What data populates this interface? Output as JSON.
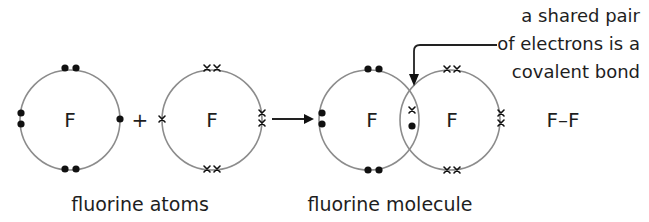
{
  "diagram": {
    "atoms_section": {
      "atom_left": {
        "symbol": "F",
        "electron_marker": "dot",
        "outer_electrons": 7
      },
      "plus_sign": "+",
      "atom_right": {
        "symbol": "F",
        "electron_marker": "cross",
        "outer_electrons": 7
      },
      "caption": "fluorine atoms"
    },
    "reaction_arrow": "right-arrow",
    "molecule_section": {
      "atom_left": {
        "symbol": "F"
      },
      "atom_right": {
        "symbol": "F"
      },
      "shared_pair": [
        "cross",
        "dot"
      ],
      "caption": "fluorine molecule",
      "structural_formula": "F–F"
    },
    "callout": {
      "lines": [
        "a shared pair",
        "of electrons is a",
        "covalent bond"
      ]
    },
    "colors": {
      "ring": "#8c8c8c",
      "electron": "#111111",
      "text": "#1e1e1e",
      "background": "#ffffff"
    }
  }
}
